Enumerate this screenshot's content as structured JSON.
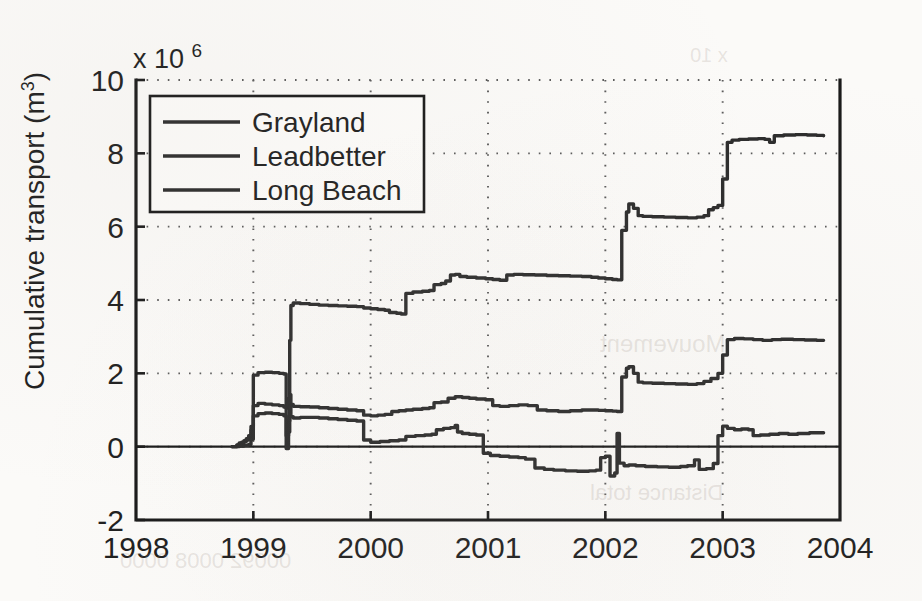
{
  "figure": {
    "background_color": "#fbfaf8",
    "ink_color": "#2c2c2c",
    "exponent_prefix": "x 10",
    "exponent_power": "6"
  },
  "chart_data": {
    "type": "line",
    "title": "",
    "subtitle": "",
    "xlabel": "",
    "ylabel": "Cumulative transport (m",
    "ylabel_superscript": "3",
    "ylabel_suffix": ")",
    "y_multiplier": "x 10^6",
    "y_multiplier_value": 1000000,
    "xlim": [
      1998,
      2004
    ],
    "ylim": [
      -2,
      10
    ],
    "xticks": [
      1998,
      1999,
      2000,
      2001,
      2002,
      2003,
      2004
    ],
    "xtick_labels": [
      "1998",
      "1999",
      "2000",
      "2001",
      "2002",
      "2003",
      "2004"
    ],
    "yticks": [
      -2,
      0,
      2,
      4,
      6,
      8,
      10
    ],
    "ytick_labels": [
      "-2",
      "0",
      "2",
      "4",
      "6",
      "8",
      "10"
    ],
    "grid": true,
    "grid_style": "dotted",
    "zero_line": true,
    "legend_position": "upper left",
    "legend_entries": [
      "Grayland",
      "Leadbetter",
      "Long Beach"
    ],
    "series": [
      {
        "name": "Grayland",
        "color": "#2c2c2c",
        "style": "solid",
        "points": [
          [
            1998.82,
            0.0
          ],
          [
            1998.86,
            0.05
          ],
          [
            1998.88,
            0.1
          ],
          [
            1998.9,
            0.12
          ],
          [
            1998.92,
            0.16
          ],
          [
            1998.94,
            0.22
          ],
          [
            1998.96,
            0.3
          ],
          [
            1998.98,
            0.55
          ],
          [
            1999.0,
            1.95
          ],
          [
            1999.04,
            2.02
          ],
          [
            1999.1,
            2.03
          ],
          [
            1999.16,
            2.02
          ],
          [
            1999.22,
            2.0
          ],
          [
            1999.26,
            1.98
          ],
          [
            1999.28,
            1.05
          ],
          [
            1999.3,
            1.3
          ],
          [
            1999.31,
            2.9
          ],
          [
            1999.32,
            3.85
          ],
          [
            1999.34,
            3.92
          ],
          [
            1999.4,
            3.9
          ],
          [
            1999.48,
            3.88
          ],
          [
            1999.56,
            3.86
          ],
          [
            1999.64,
            3.85
          ],
          [
            1999.72,
            3.84
          ],
          [
            1999.8,
            3.83
          ],
          [
            1999.88,
            3.82
          ],
          [
            1999.94,
            3.78
          ],
          [
            2000.0,
            3.76
          ],
          [
            2000.06,
            3.74
          ],
          [
            2000.12,
            3.72
          ],
          [
            2000.16,
            3.66
          ],
          [
            2000.22,
            3.64
          ],
          [
            2000.26,
            3.62
          ],
          [
            2000.3,
            4.18
          ],
          [
            2000.36,
            4.22
          ],
          [
            2000.44,
            4.24
          ],
          [
            2000.5,
            4.26
          ],
          [
            2000.54,
            4.42
          ],
          [
            2000.6,
            4.45
          ],
          [
            2000.64,
            4.52
          ],
          [
            2000.68,
            4.68
          ],
          [
            2000.72,
            4.7
          ],
          [
            2000.76,
            4.64
          ],
          [
            2000.82,
            4.62
          ],
          [
            2000.9,
            4.6
          ],
          [
            2000.98,
            4.58
          ],
          [
            2001.04,
            4.56
          ],
          [
            2001.1,
            4.54
          ],
          [
            2001.16,
            4.68
          ],
          [
            2001.22,
            4.7
          ],
          [
            2001.3,
            4.69
          ],
          [
            2001.4,
            4.68
          ],
          [
            2001.5,
            4.67
          ],
          [
            2001.6,
            4.66
          ],
          [
            2001.7,
            4.65
          ],
          [
            2001.8,
            4.64
          ],
          [
            2001.88,
            4.62
          ],
          [
            2001.94,
            4.6
          ],
          [
            2002.0,
            4.58
          ],
          [
            2002.06,
            4.56
          ],
          [
            2002.1,
            4.55
          ],
          [
            2002.14,
            5.9
          ],
          [
            2002.18,
            6.4
          ],
          [
            2002.2,
            6.62
          ],
          [
            2002.24,
            6.5
          ],
          [
            2002.28,
            6.3
          ],
          [
            2002.32,
            6.28
          ],
          [
            2002.4,
            6.27
          ],
          [
            2002.5,
            6.26
          ],
          [
            2002.6,
            6.25
          ],
          [
            2002.7,
            6.24
          ],
          [
            2002.78,
            6.26
          ],
          [
            2002.84,
            6.3
          ],
          [
            2002.88,
            6.46
          ],
          [
            2002.92,
            6.52
          ],
          [
            2002.96,
            6.58
          ],
          [
            2003.0,
            7.3
          ],
          [
            2003.04,
            8.3
          ],
          [
            2003.08,
            8.36
          ],
          [
            2003.14,
            8.38
          ],
          [
            2003.22,
            8.39
          ],
          [
            2003.3,
            8.4
          ],
          [
            2003.36,
            8.38
          ],
          [
            2003.4,
            8.3
          ],
          [
            2003.44,
            8.48
          ],
          [
            2003.52,
            8.5
          ],
          [
            2003.62,
            8.51
          ],
          [
            2003.72,
            8.5
          ],
          [
            2003.8,
            8.49
          ],
          [
            2003.86,
            8.48
          ]
        ]
      },
      {
        "name": "Leadbetter",
        "color": "#2c2c2c",
        "style": "solid",
        "points": [
          [
            1998.82,
            0.0
          ],
          [
            1998.86,
            0.04
          ],
          [
            1998.88,
            0.08
          ],
          [
            1998.9,
            0.1
          ],
          [
            1998.92,
            0.14
          ],
          [
            1998.94,
            0.18
          ],
          [
            1998.96,
            0.24
          ],
          [
            1998.98,
            0.45
          ],
          [
            1999.0,
            1.12
          ],
          [
            1999.04,
            1.18
          ],
          [
            1999.1,
            1.16
          ],
          [
            1999.16,
            1.14
          ],
          [
            1999.22,
            1.12
          ],
          [
            1999.26,
            1.08
          ],
          [
            1999.28,
            0.3
          ],
          [
            1999.3,
            0.7
          ],
          [
            1999.31,
            1.42
          ],
          [
            1999.32,
            1.15
          ],
          [
            1999.34,
            1.1
          ],
          [
            1999.4,
            1.09
          ],
          [
            1999.48,
            1.08
          ],
          [
            1999.56,
            1.06
          ],
          [
            1999.64,
            1.04
          ],
          [
            1999.72,
            1.02
          ],
          [
            1999.8,
            1.0
          ],
          [
            1999.88,
            0.98
          ],
          [
            1999.94,
            0.86
          ],
          [
            2000.0,
            0.84
          ],
          [
            2000.06,
            0.86
          ],
          [
            2000.12,
            0.88
          ],
          [
            2000.18,
            0.96
          ],
          [
            2000.24,
            0.98
          ],
          [
            2000.3,
            1.0
          ],
          [
            2000.36,
            1.02
          ],
          [
            2000.44,
            1.04
          ],
          [
            2000.5,
            1.06
          ],
          [
            2000.54,
            1.2
          ],
          [
            2000.6,
            1.22
          ],
          [
            2000.66,
            1.32
          ],
          [
            2000.72,
            1.36
          ],
          [
            2000.78,
            1.34
          ],
          [
            2000.84,
            1.32
          ],
          [
            2000.9,
            1.3
          ],
          [
            2000.98,
            1.28
          ],
          [
            2001.04,
            1.12
          ],
          [
            2001.1,
            1.1
          ],
          [
            2001.18,
            1.12
          ],
          [
            2001.26,
            1.14
          ],
          [
            2001.34,
            1.12
          ],
          [
            2001.42,
            1.0
          ],
          [
            2001.5,
            0.98
          ],
          [
            2001.6,
            0.96
          ],
          [
            2001.7,
            0.98
          ],
          [
            2001.8,
            1.0
          ],
          [
            2001.88,
            1.0
          ],
          [
            2001.94,
            0.99
          ],
          [
            2002.0,
            0.98
          ],
          [
            2002.06,
            0.97
          ],
          [
            2002.1,
            0.96
          ],
          [
            2002.14,
            1.9
          ],
          [
            2002.18,
            2.14
          ],
          [
            2002.2,
            2.18
          ],
          [
            2002.24,
            2.0
          ],
          [
            2002.28,
            1.76
          ],
          [
            2002.32,
            1.74
          ],
          [
            2002.4,
            1.73
          ],
          [
            2002.5,
            1.72
          ],
          [
            2002.6,
            1.71
          ],
          [
            2002.7,
            1.7
          ],
          [
            2002.78,
            1.72
          ],
          [
            2002.84,
            1.78
          ],
          [
            2002.9,
            1.86
          ],
          [
            2002.96,
            2.0
          ],
          [
            2003.0,
            2.5
          ],
          [
            2003.04,
            2.92
          ],
          [
            2003.1,
            2.95
          ],
          [
            2003.18,
            2.94
          ],
          [
            2003.26,
            2.92
          ],
          [
            2003.34,
            2.9
          ],
          [
            2003.42,
            2.92
          ],
          [
            2003.5,
            2.93
          ],
          [
            2003.6,
            2.92
          ],
          [
            2003.7,
            2.91
          ],
          [
            2003.8,
            2.9
          ],
          [
            2003.86,
            2.9
          ]
        ]
      },
      {
        "name": "Long Beach",
        "color": "#2c2c2c",
        "style": "solid",
        "points": [
          [
            1998.82,
            0.0
          ],
          [
            1998.88,
            0.02
          ],
          [
            1998.92,
            0.04
          ],
          [
            1998.96,
            0.06
          ],
          [
            1998.98,
            0.2
          ],
          [
            1999.0,
            0.84
          ],
          [
            1999.04,
            0.9
          ],
          [
            1999.1,
            0.92
          ],
          [
            1999.16,
            0.9
          ],
          [
            1999.22,
            0.88
          ],
          [
            1999.26,
            0.84
          ],
          [
            1999.28,
            -0.05
          ],
          [
            1999.3,
            0.4
          ],
          [
            1999.31,
            1.1
          ],
          [
            1999.32,
            0.82
          ],
          [
            1999.34,
            0.78
          ],
          [
            1999.4,
            0.8
          ],
          [
            1999.48,
            0.8
          ],
          [
            1999.56,
            0.78
          ],
          [
            1999.64,
            0.76
          ],
          [
            1999.72,
            0.74
          ],
          [
            1999.8,
            0.72
          ],
          [
            1999.88,
            0.7
          ],
          [
            1999.94,
            0.18
          ],
          [
            2000.0,
            0.12
          ],
          [
            2000.08,
            0.14
          ],
          [
            2000.16,
            0.16
          ],
          [
            2000.24,
            0.18
          ],
          [
            2000.3,
            0.28
          ],
          [
            2000.38,
            0.3
          ],
          [
            2000.46,
            0.32
          ],
          [
            2000.52,
            0.34
          ],
          [
            2000.56,
            0.46
          ],
          [
            2000.62,
            0.5
          ],
          [
            2000.68,
            0.52
          ],
          [
            2000.72,
            0.58
          ],
          [
            2000.74,
            0.4
          ],
          [
            2000.78,
            0.36
          ],
          [
            2000.84,
            0.34
          ],
          [
            2000.9,
            0.32
          ],
          [
            2000.96,
            -0.18
          ],
          [
            2001.02,
            -0.24
          ],
          [
            2001.1,
            -0.26
          ],
          [
            2001.18,
            -0.28
          ],
          [
            2001.26,
            -0.3
          ],
          [
            2001.32,
            -0.34
          ],
          [
            2001.4,
            -0.58
          ],
          [
            2001.48,
            -0.62
          ],
          [
            2001.56,
            -0.64
          ],
          [
            2001.66,
            -0.66
          ],
          [
            2001.76,
            -0.67
          ],
          [
            2001.86,
            -0.66
          ],
          [
            2001.92,
            -0.64
          ],
          [
            2001.96,
            -0.3
          ],
          [
            2002.0,
            -0.26
          ],
          [
            2002.04,
            -0.8
          ],
          [
            2002.08,
            -0.72
          ],
          [
            2002.1,
            0.36
          ],
          [
            2002.12,
            -0.45
          ],
          [
            2002.16,
            -0.52
          ],
          [
            2002.2,
            -0.5
          ],
          [
            2002.26,
            -0.52
          ],
          [
            2002.34,
            -0.54
          ],
          [
            2002.44,
            -0.55
          ],
          [
            2002.54,
            -0.56
          ],
          [
            2002.64,
            -0.54
          ],
          [
            2002.7,
            -0.52
          ],
          [
            2002.76,
            -0.36
          ],
          [
            2002.8,
            -0.62
          ],
          [
            2002.86,
            -0.6
          ],
          [
            2002.92,
            -0.46
          ],
          [
            2002.96,
            0.3
          ],
          [
            2003.0,
            0.56
          ],
          [
            2003.04,
            0.5
          ],
          [
            2003.1,
            0.46
          ],
          [
            2003.16,
            0.48
          ],
          [
            2003.22,
            0.46
          ],
          [
            2003.26,
            0.3
          ],
          [
            2003.32,
            0.32
          ],
          [
            2003.4,
            0.34
          ],
          [
            2003.48,
            0.36
          ],
          [
            2003.56,
            0.34
          ],
          [
            2003.64,
            0.36
          ],
          [
            2003.74,
            0.38
          ],
          [
            2003.82,
            0.38
          ],
          [
            2003.86,
            0.38
          ]
        ]
      }
    ]
  },
  "plot_geometry": {
    "left": 136,
    "top": 80,
    "right": 840,
    "bottom": 520
  },
  "ghost_text": [
    {
      "text": "x 10",
      "left": 690,
      "top": 44,
      "size": 20
    },
    {
      "text": "Mouvement",
      "left": 600,
      "top": 330,
      "size": 24
    },
    {
      "text": "Distance total",
      "left": 590,
      "top": 480,
      "size": 22
    },
    {
      "text": "00092 0008 0000",
      "left": 120,
      "top": 548,
      "size": 22
    }
  ]
}
